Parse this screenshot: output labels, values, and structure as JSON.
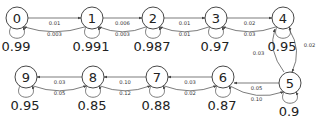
{
  "diagram": {
    "type": "markov-chain",
    "nodes": [
      {
        "id": "0",
        "label": "0",
        "x": 17,
        "y": 18,
        "self": "0.99"
      },
      {
        "id": "1",
        "label": "1",
        "x": 92,
        "y": 18,
        "self": "0.991"
      },
      {
        "id": "2",
        "label": "2",
        "x": 153,
        "y": 18,
        "self": "0.987"
      },
      {
        "id": "3",
        "label": "3",
        "x": 216,
        "y": 18,
        "self": "0.97"
      },
      {
        "id": "4",
        "label": "4",
        "x": 283,
        "y": 18,
        "self": "0.95"
      },
      {
        "id": "5",
        "label": "5",
        "x": 290,
        "y": 83,
        "self": "0.9"
      },
      {
        "id": "6",
        "label": "6",
        "x": 223,
        "y": 77,
        "self": "0.87"
      },
      {
        "id": "7",
        "label": "7",
        "x": 157,
        "y": 77,
        "self": "0.88"
      },
      {
        "id": "8",
        "label": "8",
        "x": 93,
        "y": 77,
        "self": "0.85"
      },
      {
        "id": "9",
        "label": "9",
        "x": 26,
        "y": 77,
        "self": "0.95"
      }
    ],
    "edges": [
      {
        "from": "0",
        "to": "1",
        "label": "0.01"
      },
      {
        "from": "1",
        "to": "0",
        "label": "0.003"
      },
      {
        "from": "1",
        "to": "2",
        "label": "0.006"
      },
      {
        "from": "2",
        "to": "1",
        "label": "0.003"
      },
      {
        "from": "2",
        "to": "3",
        "label": "0.01"
      },
      {
        "from": "3",
        "to": "2",
        "label": "0.01"
      },
      {
        "from": "3",
        "to": "4",
        "label": "0.02"
      },
      {
        "from": "4",
        "to": "3",
        "label": "0.03"
      },
      {
        "from": "4",
        "to": "5",
        "label": "0.02"
      },
      {
        "from": "5",
        "to": "4",
        "label": "0.03"
      },
      {
        "from": "5",
        "to": "6",
        "label": "0.05"
      },
      {
        "from": "6",
        "to": "5",
        "label": "0.10"
      },
      {
        "from": "6",
        "to": "7",
        "label": "0.03"
      },
      {
        "from": "7",
        "to": "6",
        "label": "0.02"
      },
      {
        "from": "7",
        "to": "8",
        "label": "0.10"
      },
      {
        "from": "8",
        "to": "7",
        "label": "0.12"
      },
      {
        "from": "8",
        "to": "9",
        "label": "0.03"
      },
      {
        "from": "9",
        "to": "8",
        "label": "0.05"
      }
    ]
  }
}
